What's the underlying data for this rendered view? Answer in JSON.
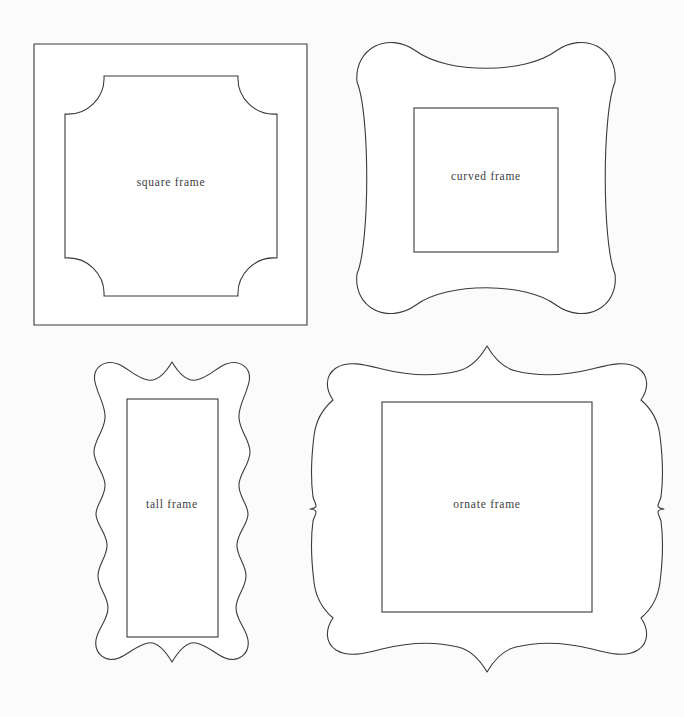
{
  "page": {
    "background_color": "#fbfbfb",
    "line_color": "#3a3a3c",
    "text_color": "#3c3c3e",
    "fill_color": "#ffffff",
    "width": 684,
    "height": 717
  },
  "frames": [
    {
      "id": "square-frame",
      "label": "square frame",
      "shape": "square",
      "outer_bounds": {
        "x": 34,
        "y": 44,
        "width": 273,
        "height": 281
      },
      "inner_bounds": {
        "x": 65,
        "y": 76,
        "width": 212,
        "height": 220
      },
      "label_position": {
        "x": 171,
        "y": 183
      },
      "corner_style": "concave-arc"
    },
    {
      "id": "curved-frame",
      "label": "curved frame",
      "shape": "curved",
      "outer_bounds": {
        "x": 355,
        "y": 42,
        "width": 262,
        "height": 272
      },
      "inner_bounds": {
        "x": 414,
        "y": 108,
        "width": 144,
        "height": 144
      },
      "label_position": {
        "x": 486,
        "y": 177
      },
      "corner_style": "bulbous-round"
    },
    {
      "id": "tall-frame",
      "label": "tall frame",
      "shape": "wavy-tall",
      "outer_bounds": {
        "x": 90,
        "y": 360,
        "width": 165,
        "height": 305
      },
      "inner_bounds": {
        "x": 127,
        "y": 399,
        "width": 91,
        "height": 238
      },
      "label_position": {
        "x": 172,
        "y": 505
      },
      "corner_style": "scalloped-wave"
    },
    {
      "id": "ornate-frame",
      "label": "ornate frame",
      "shape": "ornate-bracket",
      "outer_bounds": {
        "x": 320,
        "y": 345,
        "width": 345,
        "height": 328
      },
      "inner_bounds": {
        "x": 382,
        "y": 402,
        "width": 210,
        "height": 210
      },
      "label_position": {
        "x": 486,
        "y": 505
      },
      "corner_style": "double-lobe-bracket"
    }
  ]
}
